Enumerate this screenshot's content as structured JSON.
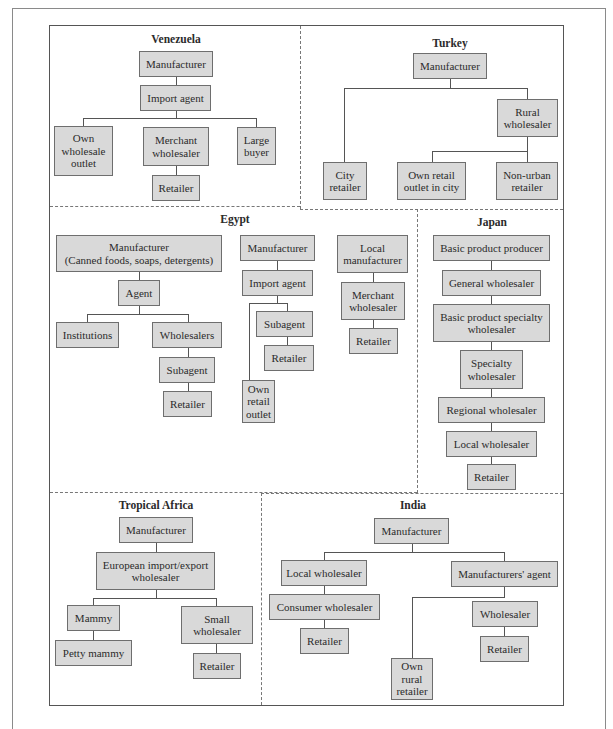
{
  "diagram": {
    "type": "distribution-channels-by-country",
    "regions": {
      "venezuela": {
        "title": "Venezuela",
        "nodes": {
          "manufacturer": "Manufacturer",
          "import_agent": "Import agent",
          "own_wholesale_outlet": "Own\nwholesale\noutlet",
          "merchant_wholesaler": "Merchant\nwholesaler",
          "large_buyer": "Large\nbuyer",
          "retailer": "Retailer"
        }
      },
      "turkey": {
        "title": "Turkey",
        "nodes": {
          "manufacturer": "Manufacturer",
          "rural_wholesaler": "Rural\nwholesaler",
          "city_retailer": "City\nretailer",
          "own_retail_outlet": "Own retail\noutlet in city",
          "non_urban_retailer": "Non-urban\nretailer"
        }
      },
      "egypt": {
        "title": "Egypt",
        "nodes": {
          "manufacturer_a": "Manufacturer\n(Canned foods, soaps, detergents)",
          "agent": "Agent",
          "institutions": "Institutions",
          "wholesalers": "Wholesalers",
          "subagent_a": "Subagent",
          "retailer_a": "Retailer",
          "manufacturer_b": "Manufacturer",
          "import_agent": "Import agent",
          "subagent_b": "Subagent",
          "retailer_b": "Retailer",
          "own_retail_outlet": "Own\nretail\noutlet",
          "local_manufacturer": "Local\nmanufacturer",
          "merchant_wholesaler": "Merchant\nwholesaler",
          "retailer_c": "Retailer"
        }
      },
      "japan": {
        "title": "Japan",
        "nodes": {
          "basic_product_producer": "Basic product producer",
          "general_wholesaler": "General wholesaler",
          "basic_product_specialty_wholesaler": "Basic product specialty\nwholesaler",
          "specialty_wholesaler": "Specialty\nwholesaler",
          "regional_wholesaler": "Regional wholesaler",
          "local_wholesaler": "Local wholesaler",
          "retailer": "Retailer"
        }
      },
      "tropical_africa": {
        "title": "Tropical Africa",
        "nodes": {
          "manufacturer": "Manufacturer",
          "european_wholesaler": "European import/export\nwholesaler",
          "mammy": "Mammy",
          "petty_mammy": "Petty mammy",
          "small_wholesaler": "Small\nwholesaler",
          "retailer": "Retailer"
        }
      },
      "india": {
        "title": "India",
        "nodes": {
          "manufacturer": "Manufacturer",
          "local_wholesaler": "Local wholesaler",
          "consumer_wholesaler": "Consumer wholesaler",
          "retailer_a": "Retailer",
          "manufacturers_agent": "Manufacturers' agent",
          "wholesaler": "Wholesaler",
          "retailer_b": "Retailer",
          "own_rural_retailer": "Own\nrural\nretailer"
        }
      }
    },
    "colors": {
      "box_fill": "#d9d9d9",
      "box_border": "#6e6e6e",
      "line": "#555555",
      "divider": "#777777"
    }
  }
}
